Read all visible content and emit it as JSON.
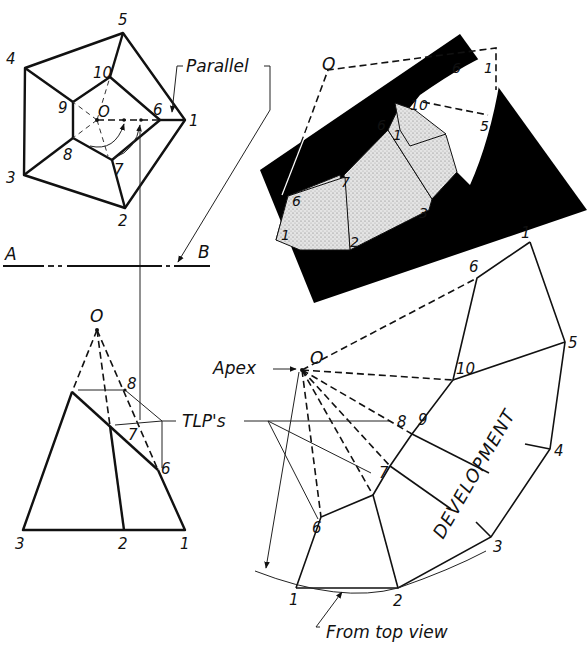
{
  "diagram": {
    "type": "descriptive-geometry-development",
    "views": [
      "top view",
      "front view",
      "pictorial",
      "development"
    ]
  },
  "top_view": {
    "apex_label": "O",
    "outer_vertices": [
      {
        "label": "1",
        "x": 185,
        "y": 120
      },
      {
        "label": "2",
        "x": 125,
        "y": 208
      },
      {
        "label": "3",
        "x": 24,
        "y": 175
      },
      {
        "label": "4",
        "x": 25,
        "y": 68
      },
      {
        "label": "5",
        "x": 123,
        "y": 33
      }
    ],
    "inner_vertices": [
      {
        "label": "6",
        "x": 160,
        "y": 120
      },
      {
        "label": "7",
        "x": 112,
        "y": 160
      },
      {
        "label": "8",
        "x": 73,
        "y": 138
      },
      {
        "label": "9",
        "x": 73,
        "y": 102
      },
      {
        "label": "10",
        "x": 110,
        "y": 77
      }
    ],
    "callout": "Parallel"
  },
  "folding_line": {
    "left_label": "A",
    "right_label": "B"
  },
  "front_view": {
    "apex_label": "O",
    "base_labels": [
      "3",
      "2",
      "1"
    ],
    "cut_labels": [
      "8",
      "7",
      "6"
    ],
    "callout": "TLP's"
  },
  "pictorial": {
    "labels": [
      "O",
      "6",
      "1",
      "10",
      "5",
      "6",
      "1",
      "7",
      "6",
      "1",
      "2",
      "3"
    ],
    "colors": {
      "background_shadow": "#000000",
      "surface_fill": "#d9d9d9"
    }
  },
  "development": {
    "apex_label": "O",
    "apex_callout": "Apex",
    "title": "DEVELOPMENT",
    "bottom_callout": "From top view",
    "base_labels": [
      "1",
      "2",
      "3",
      "4",
      "5",
      "1"
    ],
    "cut_labels": [
      "6",
      "7",
      "8",
      "9",
      "10",
      "6"
    ]
  },
  "labels": {
    "tv_4": "4",
    "tv_5": "5",
    "tv_1": "1",
    "tv_2": "2",
    "tv_3": "3",
    "tv_6": "6",
    "tv_7": "7",
    "tv_8": "8",
    "tv_9": "9",
    "tv_10": "10",
    "tv_O": "O",
    "parallel": "Parallel",
    "A": "A",
    "B": "B",
    "fv_O": "O",
    "fv_8": "8",
    "fv_7": "7",
    "fv_6": "6",
    "fv_3": "3",
    "fv_2": "2",
    "fv_1": "1",
    "tlps": "TLP's",
    "pic_O": "O",
    "pic_6top": "6",
    "pic_1top": "1",
    "pic_10": "10",
    "pic_5": "5",
    "pic_6mid": "6",
    "pic_1mid": "1",
    "pic_7": "7",
    "pic_6": "6",
    "pic_1": "1",
    "pic_2": "2",
    "pic_3": "3",
    "dv_O": "O",
    "dv_apex": "Apex",
    "dv_1top": "1",
    "dv_6top": "6",
    "dv_10": "10",
    "dv_5": "5",
    "dv_9": "9",
    "dv_8": "8",
    "dv_4": "4",
    "dv_7": "7",
    "dv_6": "6",
    "dv_3": "3",
    "dv_1": "1",
    "dv_2": "2",
    "development": "DEVELOPMENT",
    "from_top_view": "From top view"
  }
}
